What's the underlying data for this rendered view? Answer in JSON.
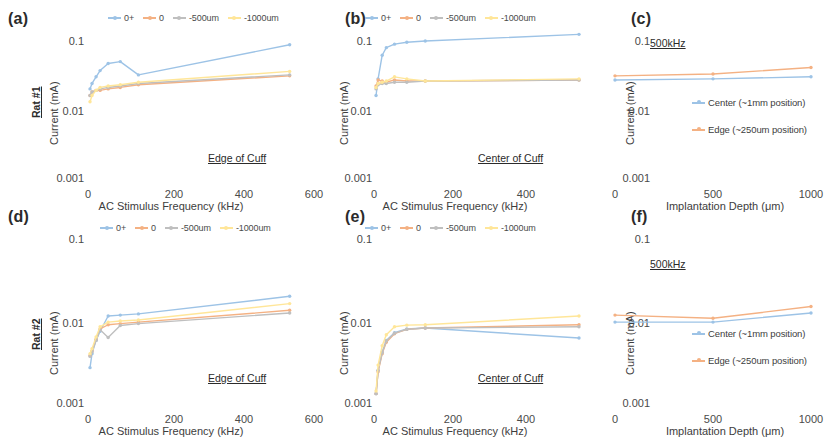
{
  "figure": {
    "series_colors": {
      "s0plus": "#9dc3e6",
      "s0": "#f4b183",
      "s500": "#bfbfbf",
      "s1000": "#ffe699",
      "center": "#9dc3e6",
      "edge": "#f4b183"
    },
    "freq_legend": [
      {
        "label": "0+",
        "color_key": "s0plus"
      },
      {
        "label": "0",
        "color_key": "s0"
      },
      {
        "label": "-500um",
        "color_key": "s500"
      },
      {
        "label": "-1000um",
        "color_key": "s1000"
      }
    ],
    "depth_legend": [
      {
        "label": "Center (~1mm position)",
        "color_key": "center"
      },
      {
        "label": "Edge (~250um position)",
        "color_key": "edge"
      }
    ],
    "row_labels": {
      "row1": "Rat #1",
      "row2": "Rat #2"
    },
    "axis_titles": {
      "current": "Current (mA)",
      "frequency": "AC Stimulus Frequency (kHz)",
      "depth": "Implantation Depth (μm)"
    },
    "yticks": [
      "0.1",
      "0.01",
      "0.001"
    ],
    "xticks_freq": [
      "0",
      "200",
      "400",
      "600"
    ],
    "xticks_depth": [
      "0",
      "500",
      "1000"
    ],
    "panel_letters": {
      "a": "(a)",
      "b": "(b)",
      "c": "(c)",
      "d": "(d)",
      "e": "(e)",
      "f": "(f)"
    },
    "annotations": {
      "edge_of_cuff": "Edge of Cuff",
      "center_of_cuff": "Center of Cuff",
      "khz500": "500kHz"
    }
  },
  "chart_data": [
    {
      "id": "a",
      "type": "line",
      "title": "(a)",
      "subject": "Rat #1",
      "annotation": "Edge of Cuff",
      "xlabel": "AC Stimulus Frequency (kHz)",
      "ylabel": "Current (mA)",
      "xlim": [
        0,
        600
      ],
      "ylim": [
        0.001,
        0.1
      ],
      "yscale": "log",
      "grid": false,
      "legend_position": "top",
      "xticks": [
        0,
        200,
        400,
        600
      ],
      "yticks": [
        0.1,
        0.01,
        0.001
      ],
      "series": [
        {
          "name": "0+",
          "x": [
            5,
            10,
            20,
            30,
            50,
            80,
            125,
            500
          ],
          "values": [
            0.02,
            0.024,
            0.03,
            0.037,
            0.047,
            0.05,
            0.032,
            0.088
          ]
        },
        {
          "name": "0",
          "x": [
            5,
            10,
            20,
            30,
            50,
            80,
            125,
            500
          ],
          "values": [
            0.016,
            0.018,
            0.019,
            0.019,
            0.02,
            0.021,
            0.023,
            0.031
          ]
        },
        {
          "name": "-500um",
          "x": [
            5,
            10,
            20,
            30,
            50,
            80,
            125,
            500
          ],
          "values": [
            0.016,
            0.018,
            0.019,
            0.02,
            0.021,
            0.022,
            0.024,
            0.032
          ]
        },
        {
          "name": "-1000um",
          "x": [
            5,
            10,
            20,
            30,
            50,
            80,
            125,
            500
          ],
          "values": [
            0.013,
            0.016,
            0.019,
            0.021,
            0.022,
            0.023,
            0.025,
            0.036
          ]
        }
      ]
    },
    {
      "id": "b",
      "type": "line",
      "title": "(b)",
      "subject": "Rat #1",
      "annotation": "Center of Cuff",
      "xlabel": "AC Stimulus Frequency (kHz)",
      "ylabel": "Current (mA)",
      "xlim": [
        0,
        600
      ],
      "ylim": [
        0.001,
        0.1
      ],
      "yscale": "log",
      "grid": false,
      "legend_position": "top",
      "xticks": [
        0,
        200,
        400,
        600
      ],
      "yticks": [
        0.1,
        0.01,
        0.001
      ],
      "series": [
        {
          "name": "0+",
          "x": [
            5,
            10,
            20,
            30,
            50,
            80,
            125,
            500
          ],
          "values": [
            0.016,
            0.028,
            0.062,
            0.08,
            0.09,
            0.096,
            0.1,
            0.125
          ]
        },
        {
          "name": "0",
          "x": [
            5,
            10,
            20,
            30,
            50,
            80,
            125,
            500
          ],
          "values": [
            0.022,
            0.027,
            0.026,
            0.025,
            0.027,
            0.026,
            0.026,
            0.027
          ]
        },
        {
          "name": "-500um",
          "x": [
            5,
            10,
            20,
            30,
            50,
            80,
            125,
            500
          ],
          "values": [
            0.02,
            0.023,
            0.024,
            0.024,
            0.025,
            0.025,
            0.026,
            0.027
          ]
        },
        {
          "name": "-1000um",
          "x": [
            5,
            10,
            20,
            30,
            50,
            80,
            125,
            500
          ],
          "values": [
            0.021,
            0.024,
            0.025,
            0.026,
            0.03,
            0.028,
            0.026,
            0.028
          ]
        }
      ]
    },
    {
      "id": "c",
      "type": "line",
      "title": "(c)",
      "subject": "Rat #1",
      "annotation": "500kHz",
      "xlabel": "Implantation Depth (μm)",
      "ylabel": "Current (mA)",
      "xlim": [
        0,
        1000
      ],
      "ylim": [
        0.001,
        0.1
      ],
      "yscale": "log",
      "grid": false,
      "legend_position": "inside-right",
      "xticks": [
        0,
        500,
        1000
      ],
      "yticks": [
        0.1,
        0.01,
        0.001
      ],
      "series": [
        {
          "name": "Center (~1mm position)",
          "x": [
            0,
            500,
            1000
          ],
          "values": [
            0.027,
            0.028,
            0.03
          ]
        },
        {
          "name": "Edge (~250um position)",
          "x": [
            0,
            500,
            1000
          ],
          "values": [
            0.031,
            0.033,
            0.041
          ]
        }
      ]
    },
    {
      "id": "d",
      "type": "line",
      "title": "(d)",
      "subject": "Rat #2",
      "annotation": "Edge of Cuff",
      "xlabel": "AC Stimulus Frequency (kHz)",
      "ylabel": "Current (mA)",
      "xlim": [
        0,
        600
      ],
      "ylim": [
        0.001,
        0.1
      ],
      "yscale": "log",
      "grid": false,
      "legend_position": "top",
      "xticks": [
        0,
        200,
        400,
        600
      ],
      "yticks": [
        0.1,
        0.01,
        0.001
      ],
      "series": [
        {
          "name": "0+",
          "x": [
            5,
            10,
            20,
            30,
            50,
            80,
            125,
            500
          ],
          "values": [
            0.0027,
            0.004,
            0.0058,
            0.0075,
            0.0115,
            0.0118,
            0.0122,
            0.02
          ]
        },
        {
          "name": "0",
          "x": [
            5,
            10,
            20,
            30,
            50,
            80,
            125,
            500
          ],
          "values": [
            0.0038,
            0.0043,
            0.006,
            0.008,
            0.009,
            0.0093,
            0.0097,
            0.0135
          ]
        },
        {
          "name": "-500um",
          "x": [
            5,
            10,
            20,
            30,
            50,
            80,
            125,
            500
          ],
          "values": [
            0.0037,
            0.0042,
            0.0058,
            0.0078,
            0.0063,
            0.0088,
            0.0093,
            0.0125
          ]
        },
        {
          "name": "-1000um",
          "x": [
            5,
            10,
            20,
            30,
            50,
            80,
            125,
            500
          ],
          "values": [
            0.004,
            0.0046,
            0.0064,
            0.0085,
            0.0097,
            0.01,
            0.0103,
            0.0163
          ]
        }
      ]
    },
    {
      "id": "e",
      "type": "line",
      "title": "(e)",
      "subject": "Rat #2",
      "annotation": "Center of Cuff",
      "xlabel": "AC Stimulus Frequency (kHz)",
      "ylabel": "Current (mA)",
      "xlim": [
        0,
        600
      ],
      "ylim": [
        0.001,
        0.1
      ],
      "yscale": "log",
      "grid": false,
      "legend_position": "top",
      "xticks": [
        0,
        200,
        400,
        600
      ],
      "yticks": [
        0.1,
        0.01,
        0.001
      ],
      "series": [
        {
          "name": "0+",
          "x": [
            5,
            10,
            20,
            30,
            50,
            80,
            125,
            500
          ],
          "values": [
            0.0013,
            0.0025,
            0.0042,
            0.0058,
            0.0072,
            0.008,
            0.0082,
            0.0062
          ]
        },
        {
          "name": "0",
          "x": [
            5,
            10,
            20,
            30,
            50,
            80,
            125,
            500
          ],
          "values": [
            0.0013,
            0.0024,
            0.004,
            0.0055,
            0.007,
            0.0079,
            0.0082,
            0.009
          ]
        },
        {
          "name": "-500um",
          "x": [
            5,
            10,
            20,
            30,
            50,
            80,
            125,
            500
          ],
          "values": [
            0.0013,
            0.0025,
            0.0041,
            0.0057,
            0.0071,
            0.0079,
            0.0082,
            0.0085
          ]
        },
        {
          "name": "-1000um",
          "x": [
            5,
            10,
            20,
            30,
            50,
            80,
            125,
            500
          ],
          "values": [
            0.0014,
            0.0029,
            0.005,
            0.0068,
            0.0085,
            0.0089,
            0.009,
            0.0115
          ]
        }
      ]
    },
    {
      "id": "f",
      "type": "line",
      "title": "(f)",
      "subject": "Rat #2",
      "annotation": "500kHz",
      "xlabel": "Implantation Depth (μm)",
      "ylabel": "Current (mA)",
      "xlim": [
        0,
        1000
      ],
      "ylim": [
        0.001,
        0.1
      ],
      "yscale": "log",
      "grid": false,
      "legend_position": "inside-right",
      "xticks": [
        0,
        500,
        1000
      ],
      "yticks": [
        0.1,
        0.01,
        0.001
      ],
      "series": [
        {
          "name": "Center (~1mm position)",
          "x": [
            0,
            500,
            1000
          ],
          "values": [
            0.0097,
            0.0097,
            0.0125
          ]
        },
        {
          "name": "Edge (~250um position)",
          "x": [
            0,
            500,
            1000
          ],
          "values": [
            0.0118,
            0.0108,
            0.015
          ]
        }
      ]
    }
  ]
}
